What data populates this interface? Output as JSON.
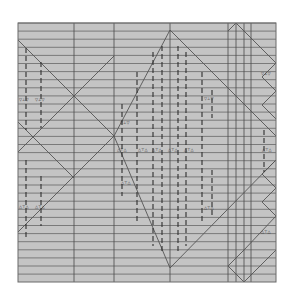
{
  "diagram": {
    "colors": {
      "background": "#ffffff",
      "paper": "#c4c4c4",
      "rule": "#5a5a5a",
      "major": "#4a4a4a",
      "diagonal": "#555555",
      "dash": "#2e2e2e",
      "border": "#6a6a6a"
    },
    "frame": {
      "x": 18,
      "y": 23,
      "w": 258,
      "h": 259
    },
    "h_rule_start": 23,
    "h_rule_step": 8.1,
    "h_rule_count": 32,
    "v_lines": [
      74,
      114,
      170,
      228,
      236,
      244,
      251
    ],
    "diagonals": [
      [
        18,
        40,
        114,
        136
      ],
      [
        18,
        152,
        114,
        56
      ],
      [
        18,
        122,
        74,
        178
      ],
      [
        18,
        232,
        114,
        136
      ],
      [
        114,
        136,
        170,
        30
      ],
      [
        170,
        30,
        276,
        136
      ],
      [
        114,
        136,
        170,
        268
      ],
      [
        170,
        268,
        276,
        160
      ],
      [
        236,
        23,
        276,
        63
      ],
      [
        236,
        23,
        228,
        31
      ],
      [
        276,
        63,
        262,
        77
      ],
      [
        262,
        77,
        276,
        91
      ],
      [
        276,
        91,
        262,
        105
      ],
      [
        262,
        105,
        276,
        119
      ],
      [
        276,
        160,
        262,
        174
      ],
      [
        262,
        174,
        276,
        188
      ],
      [
        276,
        188,
        262,
        202
      ],
      [
        262,
        202,
        276,
        216
      ],
      [
        276,
        216,
        244,
        250
      ],
      [
        244,
        250,
        228,
        266
      ],
      [
        228,
        266,
        244,
        282
      ],
      [
        244,
        282,
        276,
        250
      ]
    ],
    "dashes": [
      {
        "x": 26,
        "y1": 48,
        "y2": 130
      },
      {
        "x": 41,
        "y1": 62,
        "y2": 128
      },
      {
        "x": 26,
        "y1": 160,
        "y2": 240
      },
      {
        "x": 41,
        "y1": 176,
        "y2": 226
      },
      {
        "x": 122,
        "y1": 104,
        "y2": 196
      },
      {
        "x": 137,
        "y1": 72,
        "y2": 222
      },
      {
        "x": 153,
        "y1": 52,
        "y2": 246
      },
      {
        "x": 162,
        "y1": 46,
        "y2": 254
      },
      {
        "x": 178,
        "y1": 46,
        "y2": 254
      },
      {
        "x": 186,
        "y1": 52,
        "y2": 246
      },
      {
        "x": 202,
        "y1": 72,
        "y2": 222
      },
      {
        "x": 212,
        "y1": 90,
        "y2": 118
      },
      {
        "x": 212,
        "y1": 170,
        "y2": 216
      },
      {
        "x": 264,
        "y1": 130,
        "y2": 172
      }
    ],
    "labels": [
      {
        "x": 19,
        "y": 101,
        "text": "▽⊥▽"
      },
      {
        "x": 35,
        "y": 101,
        "text": "▽⊥▽"
      },
      {
        "x": 120,
        "y": 124,
        "text": "▽⊥▽"
      },
      {
        "x": 204,
        "y": 100,
        "text": "▽⊥▽"
      },
      {
        "x": 261,
        "y": 75,
        "text": "▽⊥▽"
      },
      {
        "x": 117,
        "y": 151,
        "text": "△⊤△"
      },
      {
        "x": 138,
        "y": 151,
        "text": "△⊤△"
      },
      {
        "x": 152,
        "y": 151,
        "text": "△⊤△"
      },
      {
        "x": 168,
        "y": 151,
        "text": "△⊤△"
      },
      {
        "x": 184,
        "y": 151,
        "text": "△⊤△"
      },
      {
        "x": 262,
        "y": 151,
        "text": "△⊤△"
      },
      {
        "x": 121,
        "y": 184,
        "text": "△⊤△"
      },
      {
        "x": 204,
        "y": 209,
        "text": "△⊤△"
      },
      {
        "x": 19,
        "y": 208,
        "text": "△⊤△"
      },
      {
        "x": 35,
        "y": 208,
        "text": "△⊤△"
      },
      {
        "x": 261,
        "y": 233,
        "text": "△⊤△"
      }
    ]
  }
}
